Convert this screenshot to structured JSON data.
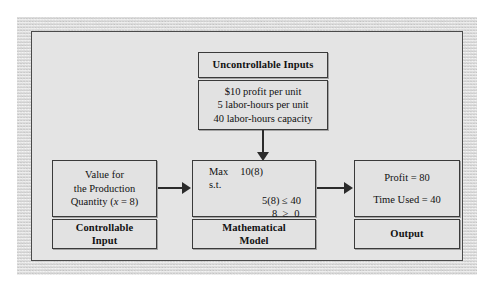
{
  "figure": {
    "type": "flow-diagram"
  },
  "boxes": {
    "uncontrollable_title": {
      "label": "Uncontrollable Inputs"
    },
    "uncontrollable_values": {
      "lines": [
        "$10 profit per unit",
        "5 labor-hours per unit",
        "40 labor-hours capacity"
      ]
    },
    "controllable_input": {
      "lines": [
        "Value for",
        "the Production"
      ],
      "quantity_prefix": "Quantity (",
      "quantity_var": "x",
      "quantity_suffix": " = 8)"
    },
    "controllable_label": {
      "lines": [
        "Controllable",
        "Input"
      ]
    },
    "math_model": {
      "objective_keyword": "Max",
      "objective_expr": "10(8)",
      "subject_to": "s.t.",
      "constraint_1": "5(8) ≤ 40",
      "constraint_2": "8  ≥  0"
    },
    "math_label": {
      "lines": [
        "Mathematical",
        "Model"
      ]
    },
    "output": {
      "lines": [
        "Profit = 80",
        "Time Used = 40"
      ]
    },
    "output_label": {
      "label": "Output"
    }
  },
  "arrows": {
    "inputs_to_model": "downward-arrow",
    "input_to_model": "right-arrow",
    "model_to_output": "right-arrow"
  },
  "colors": {
    "frame": "#dcdcdc",
    "panel": "#e4e4e4",
    "box_fill": "#e2e2e2",
    "box_border": "#3a3a3a",
    "text": "#111111",
    "arrow": "#2b2b2b"
  }
}
